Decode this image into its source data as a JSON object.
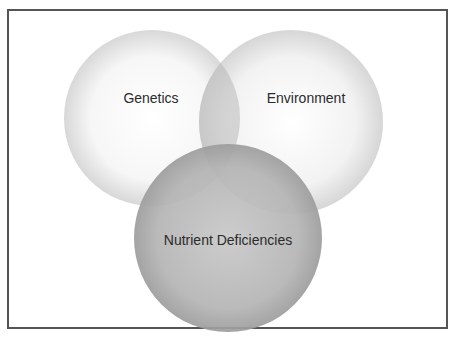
{
  "diagram": {
    "type": "venn",
    "sets": [
      {
        "label": "Genetics",
        "cx": 152,
        "cy": 118,
        "r": 88,
        "center_color": "#ffffff",
        "edge_color": "#d6d6d6"
      },
      {
        "label": "Environment",
        "cx": 291,
        "cy": 122,
        "r": 92,
        "center_color": "#ffffff",
        "edge_color": "#cfcfcf"
      },
      {
        "label": "Nutrient Deficiencies",
        "cx": 228,
        "cy": 238,
        "r": 94,
        "center_color": "#c4c4c4",
        "edge_color": "#9a9a9a"
      }
    ],
    "border_color": "#555555"
  }
}
